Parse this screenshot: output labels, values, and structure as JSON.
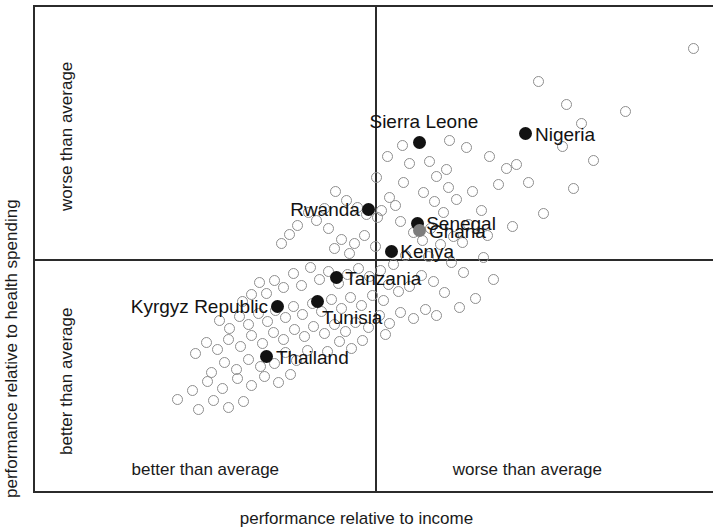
{
  "chart_data": {
    "type": "scatter",
    "title": "",
    "subtitle": "",
    "xlabel": "performance relative to income",
    "ylabel": "performance relative to health spending",
    "grid": false,
    "legend_position": "none",
    "axis_note": "Unlabelled relative axes; quadrants split by a vertical and a horizontal reference line at the average on each axis.",
    "xlim": [
      0,
      100
    ],
    "ylim": [
      0,
      100
    ],
    "quadrant_divider_x": 50.1,
    "quadrant_divider_y": 48.2,
    "x_quadrant_labels": [
      {
        "text": "better than average",
        "side": "left"
      },
      {
        "text": "worse than average",
        "side": "right"
      }
    ],
    "y_quadrant_labels": [
      {
        "text": "worse than average",
        "side": "top"
      },
      {
        "text": "better than average",
        "side": "bottom"
      }
    ],
    "series": [
      {
        "name": "labelled countries",
        "marker": "filled-circle",
        "color": "#121212",
        "points": [
          {
            "label": "Sierra Leone",
            "x": 56.6,
            "y": 72.3,
            "label_pos": "above",
            "color": "#121212"
          },
          {
            "label": "Nigeria",
            "x": 72.2,
            "y": 74.0,
            "label_pos": "right",
            "color": "#121212"
          },
          {
            "label": "Rwanda",
            "x": 49.1,
            "y": 58.6,
            "label_pos": "left",
            "color": "#121212"
          },
          {
            "label": "Senegal",
            "x": 56.2,
            "y": 55.7,
            "label_pos": "right",
            "color": "#121212"
          },
          {
            "label": "Ghana",
            "x": 56.6,
            "y": 54.1,
            "label_pos": "right",
            "color": "#7d7d7d"
          },
          {
            "label": "Kenya",
            "x": 52.4,
            "y": 50.0,
            "label_pos": "right",
            "color": "#121212"
          },
          {
            "label": "Tanzania",
            "x": 44.3,
            "y": 44.5,
            "label_pos": "right",
            "color": "#121212"
          },
          {
            "label": "Tunisia",
            "x": 41.6,
            "y": 39.7,
            "label_pos": "below-right",
            "color": "#121212"
          },
          {
            "label": "Kyrgyz Republic",
            "x": 35.6,
            "y": 38.7,
            "label_pos": "left",
            "color": "#121212"
          },
          {
            "label": "Thailand",
            "x": 34.1,
            "y": 28.3,
            "label_pos": "right",
            "color": "#121212"
          }
        ]
      },
      {
        "name": "other countries",
        "marker": "open-circle",
        "color": "#8e8e8e",
        "points": [
          {
            "x": 96.9,
            "y": 91.4
          },
          {
            "x": 86.8,
            "y": 78.6
          },
          {
            "x": 78.1,
            "y": 80.1
          },
          {
            "x": 74.0,
            "y": 84.8
          },
          {
            "x": 80.3,
            "y": 76.2
          },
          {
            "x": 66.8,
            "y": 69.3
          },
          {
            "x": 63.4,
            "y": 71.3
          },
          {
            "x": 70.8,
            "y": 67.8
          },
          {
            "x": 69.3,
            "y": 67.0
          },
          {
            "x": 72.6,
            "y": 64.1
          },
          {
            "x": 68.2,
            "y": 63.6
          },
          {
            "x": 82.1,
            "y": 68.6
          },
          {
            "x": 64.3,
            "y": 62.1
          },
          {
            "x": 60.5,
            "y": 66.8
          },
          {
            "x": 59.1,
            "y": 65.2
          },
          {
            "x": 62.0,
            "y": 60.6
          },
          {
            "x": 57.2,
            "y": 62.0
          },
          {
            "x": 55.0,
            "y": 68.0
          },
          {
            "x": 54.2,
            "y": 64.1
          },
          {
            "x": 60.0,
            "y": 57.8
          },
          {
            "x": 65.7,
            "y": 58.4
          },
          {
            "x": 77.5,
            "y": 71.5
          },
          {
            "x": 79.2,
            "y": 62.8
          },
          {
            "x": 74.8,
            "y": 57.6
          },
          {
            "x": 70.2,
            "y": 55.1
          },
          {
            "x": 53.0,
            "y": 59.3
          },
          {
            "x": 52.1,
            "y": 61.0
          },
          {
            "x": 51.0,
            "y": 58.2
          },
          {
            "x": 53.7,
            "y": 56.0
          },
          {
            "x": 50.4,
            "y": 56.9
          },
          {
            "x": 55.6,
            "y": 53.8
          },
          {
            "x": 58.2,
            "y": 54.7
          },
          {
            "x": 57.0,
            "y": 52.1
          },
          {
            "x": 59.6,
            "y": 51.3
          },
          {
            "x": 62.8,
            "y": 51.8
          },
          {
            "x": 66.0,
            "y": 48.6
          },
          {
            "x": 61.2,
            "y": 47.6
          },
          {
            "x": 54.5,
            "y": 49.0
          },
          {
            "x": 52.7,
            "y": 47.2
          },
          {
            "x": 50.1,
            "y": 51.0
          },
          {
            "x": 48.4,
            "y": 53.1
          },
          {
            "x": 47.0,
            "y": 51.6
          },
          {
            "x": 46.2,
            "y": 49.4
          },
          {
            "x": 45.0,
            "y": 52.4
          },
          {
            "x": 44.0,
            "y": 50.6
          },
          {
            "x": 43.1,
            "y": 54.6
          },
          {
            "x": 41.4,
            "y": 56.2
          },
          {
            "x": 40.2,
            "y": 57.8
          },
          {
            "x": 42.5,
            "y": 58.7
          },
          {
            "x": 38.6,
            "y": 55.2
          },
          {
            "x": 37.4,
            "y": 53.4
          },
          {
            "x": 36.2,
            "y": 51.6
          },
          {
            "x": 50.8,
            "y": 46.0
          },
          {
            "x": 49.2,
            "y": 44.8
          },
          {
            "x": 47.6,
            "y": 46.4
          },
          {
            "x": 46.0,
            "y": 45.1
          },
          {
            "x": 44.6,
            "y": 43.4
          },
          {
            "x": 43.2,
            "y": 45.8
          },
          {
            "x": 41.8,
            "y": 44.2
          },
          {
            "x": 40.5,
            "y": 46.6
          },
          {
            "x": 39.2,
            "y": 43.0
          },
          {
            "x": 38.0,
            "y": 45.4
          },
          {
            "x": 36.6,
            "y": 42.6
          },
          {
            "x": 35.2,
            "y": 44.0
          },
          {
            "x": 34.0,
            "y": 41.2
          },
          {
            "x": 33.0,
            "y": 43.6
          },
          {
            "x": 31.8,
            "y": 41.0
          },
          {
            "x": 30.5,
            "y": 39.6
          },
          {
            "x": 52.0,
            "y": 43.2
          },
          {
            "x": 53.4,
            "y": 41.6
          },
          {
            "x": 55.1,
            "y": 42.8
          },
          {
            "x": 56.8,
            "y": 45.0
          },
          {
            "x": 58.6,
            "y": 43.8
          },
          {
            "x": 60.2,
            "y": 41.4
          },
          {
            "x": 51.2,
            "y": 39.8
          },
          {
            "x": 49.6,
            "y": 40.8
          },
          {
            "x": 48.0,
            "y": 38.9
          },
          {
            "x": 46.4,
            "y": 40.4
          },
          {
            "x": 45.0,
            "y": 38.2
          },
          {
            "x": 43.6,
            "y": 40.0
          },
          {
            "x": 42.2,
            "y": 37.6
          },
          {
            "x": 40.8,
            "y": 39.2
          },
          {
            "x": 39.4,
            "y": 37.0
          },
          {
            "x": 38.0,
            "y": 38.6
          },
          {
            "x": 36.8,
            "y": 36.4
          },
          {
            "x": 35.4,
            "y": 37.8
          },
          {
            "x": 34.2,
            "y": 35.6
          },
          {
            "x": 32.8,
            "y": 37.2
          },
          {
            "x": 31.4,
            "y": 35.0
          },
          {
            "x": 30.0,
            "y": 36.6
          },
          {
            "x": 28.6,
            "y": 34.2
          },
          {
            "x": 27.2,
            "y": 35.8
          },
          {
            "x": 47.2,
            "y": 35.4
          },
          {
            "x": 45.6,
            "y": 33.6
          },
          {
            "x": 44.1,
            "y": 35.0
          },
          {
            "x": 42.6,
            "y": 33.0
          },
          {
            "x": 41.0,
            "y": 34.6
          },
          {
            "x": 39.6,
            "y": 32.4
          },
          {
            "x": 38.2,
            "y": 34.0
          },
          {
            "x": 36.6,
            "y": 31.8
          },
          {
            "x": 35.0,
            "y": 33.4
          },
          {
            "x": 33.4,
            "y": 31.0
          },
          {
            "x": 31.8,
            "y": 32.6
          },
          {
            "x": 30.2,
            "y": 30.4
          },
          {
            "x": 28.4,
            "y": 31.8
          },
          {
            "x": 26.8,
            "y": 29.8
          },
          {
            "x": 25.2,
            "y": 31.2
          },
          {
            "x": 23.6,
            "y": 29.0
          },
          {
            "x": 40.0,
            "y": 29.6
          },
          {
            "x": 38.4,
            "y": 27.6
          },
          {
            "x": 36.8,
            "y": 29.2
          },
          {
            "x": 35.2,
            "y": 27.0
          },
          {
            "x": 33.2,
            "y": 26.4
          },
          {
            "x": 31.4,
            "y": 27.8
          },
          {
            "x": 29.6,
            "y": 25.8
          },
          {
            "x": 27.8,
            "y": 27.2
          },
          {
            "x": 26.0,
            "y": 25.2
          },
          {
            "x": 37.6,
            "y": 24.6
          },
          {
            "x": 35.8,
            "y": 23.0
          },
          {
            "x": 33.8,
            "y": 24.2
          },
          {
            "x": 31.8,
            "y": 22.4
          },
          {
            "x": 29.8,
            "y": 23.8
          },
          {
            "x": 27.6,
            "y": 21.8
          },
          {
            "x": 25.4,
            "y": 23.2
          },
          {
            "x": 23.2,
            "y": 21.4
          },
          {
            "x": 21.0,
            "y": 19.6
          },
          {
            "x": 30.6,
            "y": 19.2
          },
          {
            "x": 28.4,
            "y": 18.0
          },
          {
            "x": 26.2,
            "y": 19.4
          },
          {
            "x": 24.0,
            "y": 17.6
          },
          {
            "x": 63.0,
            "y": 45.6
          },
          {
            "x": 67.4,
            "y": 44.2
          },
          {
            "x": 59.0,
            "y": 36.8
          },
          {
            "x": 62.4,
            "y": 38.4
          },
          {
            "x": 64.8,
            "y": 40.2
          },
          {
            "x": 57.4,
            "y": 38.0
          },
          {
            "x": 55.6,
            "y": 36.2
          },
          {
            "x": 53.8,
            "y": 37.4
          },
          {
            "x": 52.2,
            "y": 35.2
          },
          {
            "x": 50.6,
            "y": 36.8
          },
          {
            "x": 49.0,
            "y": 34.4
          },
          {
            "x": 51.6,
            "y": 32.8
          },
          {
            "x": 48.2,
            "y": 31.6
          },
          {
            "x": 46.6,
            "y": 30.0
          },
          {
            "x": 44.8,
            "y": 31.4
          },
          {
            "x": 43.0,
            "y": 29.4
          },
          {
            "x": 57.8,
            "y": 48.8
          },
          {
            "x": 61.6,
            "y": 53.0
          },
          {
            "x": 63.8,
            "y": 55.4
          },
          {
            "x": 66.6,
            "y": 53.2
          },
          {
            "x": 48.8,
            "y": 57.4
          },
          {
            "x": 47.4,
            "y": 59.0
          },
          {
            "x": 45.8,
            "y": 60.4
          },
          {
            "x": 44.2,
            "y": 62.2
          },
          {
            "x": 54.0,
            "y": 71.6
          },
          {
            "x": 51.8,
            "y": 69.4
          },
          {
            "x": 58.0,
            "y": 68.4
          },
          {
            "x": 61.0,
            "y": 72.6
          },
          {
            "x": 50.2,
            "y": 65.0
          },
          {
            "x": 58.8,
            "y": 60.2
          },
          {
            "x": 60.8,
            "y": 63.0
          }
        ]
      }
    ]
  },
  "axes": {
    "x_title": "performance relative to income",
    "y_title": "performance relative to health spending"
  },
  "quadrants": {
    "x_left": "better than average",
    "x_right": "worse than average",
    "y_top": "worse than average",
    "y_bottom": "better than average"
  },
  "labels": {
    "sierra_leone": "Sierra Leone",
    "nigeria": "Nigeria",
    "rwanda": "Rwanda",
    "senegal": "Senegal",
    "ghana": "Ghana",
    "kenya": "Kenya",
    "tanzania": "Tanzania",
    "tunisia": "Tunisia",
    "kyrgyz_republic": "Kyrgyz Republic",
    "thailand": "Thailand"
  },
  "colors": {
    "frame": "#2b2b2b",
    "open_marker": "#8e8e8e",
    "solid_marker": "#121212",
    "gray_marker": "#7d7d7d",
    "text": "#1a1a1a",
    "background": "#ffffff"
  }
}
